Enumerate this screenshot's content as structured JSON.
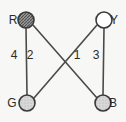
{
  "diagram": {
    "background_color": "#f7f7f5",
    "stroke_color": "#4a4a4a",
    "nodes": [
      {
        "id": "R",
        "label": "R",
        "fill": "#8c8c8c",
        "pattern": "hatched-dark",
        "cx": 26,
        "cy": 20,
        "r": 8,
        "label_x": 13,
        "label_y": 24
      },
      {
        "id": "Y",
        "label": "Y",
        "fill": "#ffffff",
        "pattern": "none",
        "cx": 104,
        "cy": 20,
        "r": 8,
        "label_x": 114,
        "label_y": 24
      },
      {
        "id": "G",
        "label": "G",
        "fill": "#cfcfcf",
        "pattern": "light",
        "cx": 27,
        "cy": 103,
        "r": 8,
        "label_x": 12,
        "label_y": 107
      },
      {
        "id": "B",
        "label": "B",
        "fill": "#cfcfcf",
        "pattern": "light",
        "cx": 103,
        "cy": 103,
        "r": 8,
        "label_x": 113,
        "label_y": 107
      }
    ],
    "edges": [
      {
        "id": "R-G",
        "from": "R",
        "to": "G",
        "weight": "4",
        "x1": 26,
        "y1": 28,
        "x2": 27,
        "y2": 95,
        "label_x": 14,
        "label_y": 59
      },
      {
        "id": "R-B",
        "from": "R",
        "to": "B",
        "weight": "2",
        "x1": 33,
        "y1": 25,
        "x2": 97,
        "y2": 98,
        "label_x": 30,
        "label_y": 59
      },
      {
        "id": "Y-G",
        "from": "Y",
        "to": "G",
        "weight": "1",
        "x1": 97,
        "y1": 25,
        "x2": 34,
        "y2": 98,
        "label_x": 77,
        "label_y": 59
      },
      {
        "id": "Y-B",
        "from": "Y",
        "to": "B",
        "weight": "3",
        "x1": 104,
        "y1": 28,
        "x2": 103,
        "y2": 95,
        "label_x": 96,
        "label_y": 59
      }
    ]
  }
}
